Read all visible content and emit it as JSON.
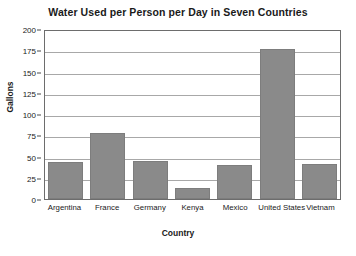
{
  "chart_data": {
    "type": "bar",
    "title": "Water Used per Person per Day in Seven Countries",
    "xlabel": "Country",
    "ylabel": "Gallons",
    "categories": [
      "Argentina",
      "France",
      "Germany",
      "Kenya",
      "Mexico",
      "United States",
      "Vietnam"
    ],
    "values": [
      44,
      78,
      45,
      13,
      40,
      176,
      41
    ],
    "ylim": [
      0,
      200
    ],
    "yticks": [
      0,
      25,
      50,
      75,
      100,
      125,
      150,
      175,
      200
    ],
    "ytick_labels": [
      "0",
      "25",
      "50",
      "75",
      "100",
      "125",
      "150",
      "175",
      "200"
    ],
    "grid": "horizontal",
    "legend": "none",
    "bar_color": "#8a8a8a",
    "bar_edge_color": "#7d7d7d",
    "gridline_color": "#a8a8a8",
    "axis_color": "#6d6d6d",
    "background_color": "#ffffff"
  }
}
